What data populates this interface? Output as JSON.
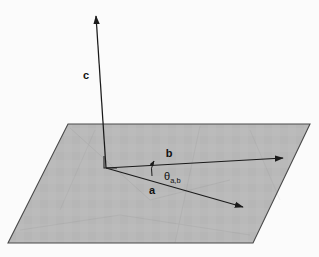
{
  "figure": {
    "background_color": "#fbfbfb",
    "plane": {
      "name": "plane-spanned-by-a-and-b",
      "fill_color": "#b9b9b9",
      "stroke_color": "#4a4a4a",
      "points": "68,124 310,124 253,243 8,243"
    },
    "origin": {
      "x": 106,
      "y": 168
    },
    "right_angle_marker": {
      "label": "right-angle",
      "points": "104,156 104,168 117,168",
      "stroke_color": "#222222"
    },
    "vectors": [
      {
        "id": "c",
        "label": "c",
        "description": "vector c perpendicular to the plane",
        "x1": 106,
        "y1": 168,
        "x2": 96,
        "y2": 16,
        "label_x": 86,
        "label_y": 79,
        "color": "#1a1a1a"
      },
      {
        "id": "b",
        "label": "b",
        "description": "vector b in the plane",
        "x1": 106,
        "y1": 168,
        "x2": 283,
        "y2": 158,
        "label_x": 169,
        "label_y": 157,
        "color": "#1a1a1a"
      },
      {
        "id": "a",
        "label": "a",
        "description": "vector a in the plane",
        "x1": 106,
        "y1": 168,
        "x2": 243,
        "y2": 207,
        "label_x": 152,
        "label_y": 194,
        "color": "#1a1a1a"
      }
    ],
    "angle": {
      "symbol": "θ",
      "subscript": "a,b",
      "description": "angle between vector a and vector b",
      "label_x": 164,
      "label_y": 180,
      "arc_path": "M 152,176 Q 150,168 154,161",
      "arc_color": "#1a1a1a"
    }
  }
}
